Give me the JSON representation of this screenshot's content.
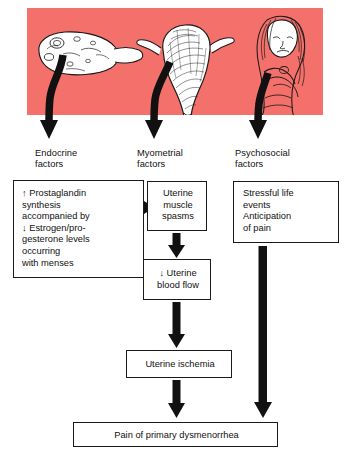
{
  "figure": {
    "type": "flowchart",
    "illustration": {
      "background_color": "#f4706b",
      "panels": [
        {
          "name": "ovary-illustration",
          "label": "ovary with follicles"
        },
        {
          "name": "uterus-illustration",
          "label": "uterus with fallopian tubes"
        },
        {
          "name": "woman-illustration",
          "label": "woman in distress holding abdomen"
        }
      ]
    },
    "columns": [
      {
        "id": "endocrine",
        "heading": "Endocrine\nfactors"
      },
      {
        "id": "myometrial",
        "heading": "Myometrial\nfactors"
      },
      {
        "id": "psychosocial",
        "heading": "Psychosocial\nfactors"
      }
    ],
    "boxes": {
      "endocrine": "↑ Prostaglandin\n   synthesis\n   accompanied by\n↓ Estrogen/pro-\n   gesterone levels\n   occurring\n   with menses",
      "myometrial": "Uterine\nmuscle\nspasms",
      "blood_flow": "↓ Uterine\nblood flow",
      "psychosocial": "Stressful life\nevents\nAnticipation\nof pain",
      "ischemia": "Uterine ischemia",
      "pain": "Pain of primary dysmenorrhea"
    },
    "arrows": [
      {
        "name": "arrow-ovary-to-endocrine",
        "direction": "down-curved"
      },
      {
        "name": "arrow-uterus-to-myometrial",
        "direction": "down-curved"
      },
      {
        "name": "arrow-woman-to-psychosocial",
        "direction": "down-curved"
      },
      {
        "name": "arrow-endocrine-to-myometrial",
        "direction": "right"
      },
      {
        "name": "arrow-myometrial-to-bloodflow",
        "direction": "down"
      },
      {
        "name": "arrow-bloodflow-to-ischemia",
        "direction": "down"
      },
      {
        "name": "arrow-ischemia-to-pain",
        "direction": "down"
      },
      {
        "name": "arrow-psychosocial-to-pain",
        "direction": "down-long"
      }
    ]
  }
}
